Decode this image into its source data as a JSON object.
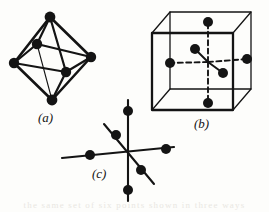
{
  "plate": {
    "title": "Octahedral coordination — three representations",
    "width": 269,
    "height": 212,
    "background": "#fdfdfb",
    "ink": "#141414",
    "bleed_text": "the same set of six points shown in three ways"
  },
  "captions": {
    "a": "(a)",
    "b": "(b)",
    "c": "(c)"
  },
  "figures": [
    {
      "id": "a",
      "name": "octahedron",
      "caption": "(a)",
      "description": "Regular octahedron drawn as a solid wireframe with six filled vertices and twelve edges",
      "vertex_count": 6,
      "edge_count": 12,
      "vertices": [
        {
          "label": "top",
          "x": 50,
          "y": 17
        },
        {
          "label": "bottom",
          "x": 52,
          "y": 100
        },
        {
          "label": "left",
          "x": 14,
          "y": 63
        },
        {
          "label": "right",
          "x": 91,
          "y": 57
        },
        {
          "label": "front-inner",
          "x": 66,
          "y": 72
        },
        {
          "label": "back-inner",
          "x": 37,
          "y": 44
        }
      ],
      "dot_radius": 5.2
    },
    {
      "id": "b",
      "name": "cube-with-face-centers",
      "caption": "(b)",
      "description": "Cube in oblique projection with six filled dots at the face centres joined to the body centre by dashed lines",
      "vertex_count": 6,
      "cube_corners": {
        "front_top_left": {
          "x": 152,
          "y": 33
        },
        "front_top_right": {
          "x": 233,
          "y": 33
        },
        "front_bot_left": {
          "x": 152,
          "y": 110
        },
        "front_bot_right": {
          "x": 233,
          "y": 110
        },
        "back_top_left": {
          "x": 170,
          "y": 12
        },
        "back_top_right": {
          "x": 251,
          "y": 12
        },
        "back_bot_left": {
          "x": 170,
          "y": 89
        },
        "back_bot_right": {
          "x": 251,
          "y": 89
        }
      },
      "center": {
        "x": 208,
        "y": 62
      },
      "face_dots": [
        {
          "label": "top",
          "x": 208,
          "y": 22
        },
        {
          "label": "bottom",
          "x": 208,
          "y": 103
        },
        {
          "label": "left",
          "x": 170,
          "y": 63
        },
        {
          "label": "right",
          "x": 247,
          "y": 59
        },
        {
          "label": "back",
          "x": 195,
          "y": 49
        },
        {
          "label": "front",
          "x": 223,
          "y": 73
        }
      ],
      "dot_radius": 5.0,
      "line_style_inner": "dashed-and-solid"
    },
    {
      "id": "c",
      "name": "three-axis-star",
      "caption": "(c)",
      "description": "Three mutually perpendicular axes through a common origin, each carrying two filled dots",
      "vertex_count": 6,
      "center": {
        "x": 128,
        "y": 152
      },
      "axes": [
        {
          "label": "vertical",
          "from": {
            "x": 128,
            "y": 100
          },
          "to": {
            "x": 128,
            "y": 201
          }
        },
        {
          "label": "horizontal",
          "from": {
            "x": 62,
            "y": 158
          },
          "to": {
            "x": 174,
            "y": 147
          }
        },
        {
          "label": "diagonal",
          "from": {
            "x": 104,
            "y": 124
          },
          "to": {
            "x": 154,
            "y": 184
          }
        }
      ],
      "dots": [
        {
          "label": "up",
          "x": 128,
          "y": 111
        },
        {
          "label": "down",
          "x": 128,
          "y": 190
        },
        {
          "label": "left",
          "x": 90,
          "y": 155
        },
        {
          "label": "right",
          "x": 166,
          "y": 149
        },
        {
          "label": "back-upper",
          "x": 116,
          "y": 135
        },
        {
          "label": "front-lower",
          "x": 141,
          "y": 170
        }
      ],
      "dot_radius": 5.0
    }
  ]
}
